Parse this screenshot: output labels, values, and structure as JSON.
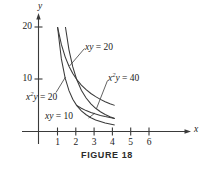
{
  "figure": {
    "caption": "FIGURE 18",
    "axis_x_label": "x",
    "axis_y_label": "y"
  },
  "chart_data": {
    "type": "line",
    "title": "FIGURE 18",
    "xlabel": "x",
    "ylabel": "y",
    "xlim": [
      0,
      6.8
    ],
    "ylim": [
      0,
      21.5
    ],
    "grid": false,
    "legend": "inline-annotations",
    "x_ticks": [
      1,
      2,
      3,
      4,
      5,
      6
    ],
    "y_ticks": [
      10,
      20
    ],
    "annotations": [
      {
        "text": "xy = 20",
        "x": 2.1,
        "y": 15.8
      },
      {
        "text": "x^2y = 40",
        "x": 3.25,
        "y": 11.2
      },
      {
        "text": "x^2y = 20",
        "x": 0.25,
        "y": 6.4
      },
      {
        "text": "xy = 10",
        "x": 1.0,
        "y": 3.2
      }
    ],
    "series": [
      {
        "name": "xy = 20",
        "equation": "xy = 20",
        "x": [
          1.0,
          1.2,
          1.4,
          1.6,
          1.8,
          2.0,
          2.25,
          2.5,
          2.75,
          3.0,
          3.25,
          3.5,
          3.75,
          4.0
        ],
        "values": [
          20.0,
          16.67,
          14.29,
          12.5,
          11.11,
          10.0,
          8.89,
          8.0,
          7.27,
          6.67,
          6.15,
          5.71,
          5.33,
          5.0
        ]
      },
      {
        "name": "x^2y = 40",
        "equation": "x^2 y = 40",
        "x": [
          1.414,
          1.6,
          1.8,
          2.0,
          2.25,
          2.5,
          2.75,
          3.0,
          3.25,
          3.5,
          3.75,
          4.0
        ],
        "values": [
          20.0,
          15.63,
          12.35,
          10.0,
          7.9,
          6.4,
          5.29,
          4.44,
          3.79,
          3.27,
          2.84,
          2.5
        ]
      },
      {
        "name": "x^2y = 20",
        "equation": "x^2 y = 20",
        "x": [
          1.0,
          1.2,
          1.4,
          1.6,
          1.8,
          2.0,
          2.25,
          2.5,
          2.75,
          3.0,
          3.5,
          4.0
        ],
        "values": [
          20.0,
          13.89,
          10.2,
          7.81,
          6.17,
          5.0,
          3.95,
          3.2,
          2.64,
          2.22,
          1.63,
          1.25
        ]
      },
      {
        "name": "xy = 10",
        "equation": "xy = 10",
        "x": [
          2.0,
          2.25,
          2.5,
          2.75,
          3.0,
          3.25,
          3.5,
          3.75,
          4.0
        ],
        "values": [
          5.0,
          4.44,
          4.0,
          3.64,
          3.33,
          3.08,
          2.86,
          2.67,
          2.5
        ]
      }
    ],
    "region_vertices": [
      {
        "x": 1.0,
        "y": 20.0
      },
      {
        "x": 1.414,
        "y": 20.0
      },
      {
        "x": 4.0,
        "y": 2.5
      },
      {
        "x": 2.0,
        "y": 5.0
      }
    ]
  },
  "labels": {
    "y_20": "20",
    "y_10": "10",
    "x_1": "1",
    "x_2": "2",
    "x_3": "3",
    "x_4": "4",
    "x_5": "5",
    "x_6": "6"
  }
}
